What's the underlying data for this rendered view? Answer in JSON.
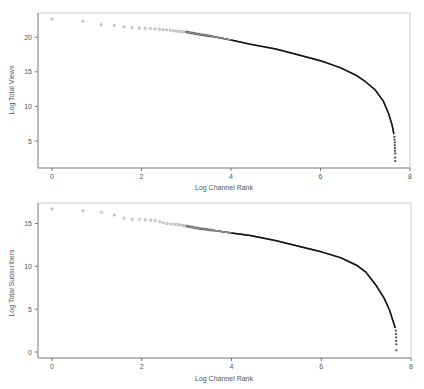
{
  "chart_data": [
    {
      "type": "scatter",
      "title": "",
      "xlabel": "Log Channel Rank",
      "ylabel": "Log Total Views",
      "xlim": [
        -0.3,
        8
      ],
      "ylim": [
        1.1,
        23.5
      ],
      "xticks": [
        0,
        2,
        4,
        6,
        8
      ],
      "yticks": [
        5,
        10,
        15,
        20
      ],
      "grid": false,
      "legend": null,
      "head_points": [
        [
          0.0,
          22.6
        ],
        [
          0.69,
          22.3
        ],
        [
          1.1,
          21.8
        ],
        [
          1.39,
          21.7
        ],
        [
          1.61,
          21.5
        ],
        [
          1.79,
          21.4
        ],
        [
          1.95,
          21.3
        ],
        [
          2.08,
          21.3
        ],
        [
          2.2,
          21.25
        ],
        [
          2.3,
          21.2
        ],
        [
          2.4,
          21.15
        ],
        [
          2.48,
          21.1
        ],
        [
          2.56,
          21.05
        ],
        [
          2.64,
          21.0
        ],
        [
          2.71,
          20.95
        ],
        [
          2.77,
          20.9
        ],
        [
          2.83,
          20.85
        ],
        [
          2.89,
          20.8
        ],
        [
          2.94,
          20.8
        ],
        [
          3.0,
          20.75
        ]
      ],
      "curve_points": [
        [
          3.0,
          20.75
        ],
        [
          3.31,
          20.4
        ],
        [
          3.6,
          20.1
        ],
        [
          4.0,
          19.6
        ],
        [
          4.42,
          19.0
        ],
        [
          5.0,
          18.3
        ],
        [
          5.54,
          17.4
        ],
        [
          6.0,
          16.6
        ],
        [
          6.44,
          15.6
        ],
        [
          6.8,
          14.5
        ],
        [
          7.0,
          13.6
        ],
        [
          7.22,
          12.4
        ],
        [
          7.4,
          10.8
        ],
        [
          7.52,
          9.0
        ],
        [
          7.6,
          7.3
        ],
        [
          7.64,
          6.0
        ]
      ],
      "tail_points": [
        [
          7.65,
          5.6
        ],
        [
          7.655,
          5.2
        ],
        [
          7.66,
          4.8
        ],
        [
          7.66,
          4.4
        ],
        [
          7.665,
          4.0
        ],
        [
          7.665,
          3.6
        ],
        [
          7.67,
          3.2
        ],
        [
          7.67,
          2.6
        ],
        [
          7.67,
          2.1
        ]
      ]
    },
    {
      "type": "scatter",
      "title": "",
      "xlabel": "Log Channel Rank",
      "ylabel": "Log Total Subscribers",
      "xlim": [
        -0.3,
        8
      ],
      "ylim": [
        -0.7,
        17.4
      ],
      "xticks": [
        0,
        2,
        4,
        6,
        8
      ],
      "yticks": [
        0,
        5,
        10,
        15
      ],
      "grid": false,
      "legend": null,
      "head_points": [
        [
          0.0,
          16.7
        ],
        [
          0.69,
          16.5
        ],
        [
          1.1,
          16.3
        ],
        [
          1.39,
          16.0
        ],
        [
          1.61,
          15.6
        ],
        [
          1.79,
          15.5
        ],
        [
          1.95,
          15.5
        ],
        [
          2.08,
          15.45
        ],
        [
          2.2,
          15.4
        ],
        [
          2.3,
          15.35
        ],
        [
          2.4,
          15.2
        ],
        [
          2.48,
          15.1
        ],
        [
          2.56,
          15.0
        ],
        [
          2.64,
          14.95
        ],
        [
          2.71,
          14.9
        ],
        [
          2.77,
          14.9
        ],
        [
          2.83,
          14.85
        ],
        [
          2.89,
          14.8
        ],
        [
          2.94,
          14.75
        ],
        [
          3.0,
          14.7
        ]
      ],
      "curve_points": [
        [
          3.0,
          14.7
        ],
        [
          3.31,
          14.4
        ],
        [
          3.6,
          14.2
        ],
        [
          4.0,
          13.9
        ],
        [
          4.42,
          13.6
        ],
        [
          5.0,
          13.0
        ],
        [
          5.54,
          12.3
        ],
        [
          6.0,
          11.7
        ],
        [
          6.44,
          11.0
        ],
        [
          6.8,
          10.1
        ],
        [
          7.0,
          9.3
        ],
        [
          7.22,
          7.8
        ],
        [
          7.4,
          6.3
        ],
        [
          7.52,
          4.9
        ],
        [
          7.6,
          3.6
        ],
        [
          7.65,
          2.8
        ]
      ],
      "tail_points": [
        [
          7.66,
          2.5
        ],
        [
          7.665,
          2.1
        ],
        [
          7.67,
          1.7
        ],
        [
          7.67,
          1.3
        ],
        [
          7.675,
          0.9
        ],
        [
          7.675,
          0.2
        ]
      ]
    }
  ],
  "panels": [
    {
      "box": {
        "left": 38,
        "top": 13,
        "right": 410,
        "bottom": 168
      }
    },
    {
      "box": {
        "left": 38,
        "top": 203,
        "right": 411,
        "bottom": 358
      }
    }
  ],
  "colors": {
    "axis": "#777777",
    "frame": "#cccccc",
    "head_point": "#9a9a9a",
    "curve": "#111111",
    "text": "#555555"
  }
}
